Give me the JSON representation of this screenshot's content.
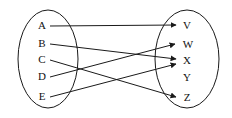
{
  "figure": {
    "type": "mapping-diagram",
    "background_color": "#ffffff",
    "stroke_color": "#1a1a1a",
    "width": 232,
    "height": 118
  },
  "domain_set": {
    "name": "domain-ellipse",
    "center_x": 48,
    "center_y": 59,
    "radius_x": 30,
    "radius_y": 49,
    "nodes": [
      {
        "id": "A",
        "label": "A",
        "x": 42,
        "y": 26
      },
      {
        "id": "B",
        "label": "B",
        "x": 42,
        "y": 44
      },
      {
        "id": "C",
        "label": "C",
        "x": 42,
        "y": 60
      },
      {
        "id": "D",
        "label": "D",
        "x": 42,
        "y": 77
      },
      {
        "id": "E",
        "label": "E",
        "x": 42,
        "y": 97
      }
    ]
  },
  "codomain_set": {
    "name": "codomain-ellipse",
    "center_x": 187,
    "center_y": 59,
    "radius_x": 32,
    "radius_y": 49,
    "nodes": [
      {
        "id": "V",
        "label": "V",
        "x": 187,
        "y": 26
      },
      {
        "id": "W",
        "label": "W",
        "x": 188,
        "y": 45
      },
      {
        "id": "X",
        "label": "X",
        "x": 187,
        "y": 61
      },
      {
        "id": "Y",
        "label": "Y",
        "x": 187,
        "y": 78
      },
      {
        "id": "Z",
        "label": "Z",
        "x": 187,
        "y": 98
      }
    ]
  },
  "edges": [
    {
      "id": "A-V",
      "from": "A",
      "to": "V",
      "x1": 50,
      "y1": 26,
      "x2": 176,
      "y2": 25
    },
    {
      "id": "B-X",
      "from": "B",
      "to": "X",
      "x1": 50,
      "y1": 44,
      "x2": 176,
      "y2": 59
    },
    {
      "id": "C-Z",
      "from": "C",
      "to": "Z",
      "x1": 50,
      "y1": 60,
      "x2": 176,
      "y2": 97
    },
    {
      "id": "D-W",
      "from": "D",
      "to": "W",
      "x1": 50,
      "y1": 77,
      "x2": 175,
      "y2": 44
    },
    {
      "id": "E-X",
      "from": "E",
      "to": "X",
      "x1": 50,
      "y1": 97,
      "x2": 176,
      "y2": 64
    }
  ],
  "unmapped_nodes": [
    "Y"
  ]
}
